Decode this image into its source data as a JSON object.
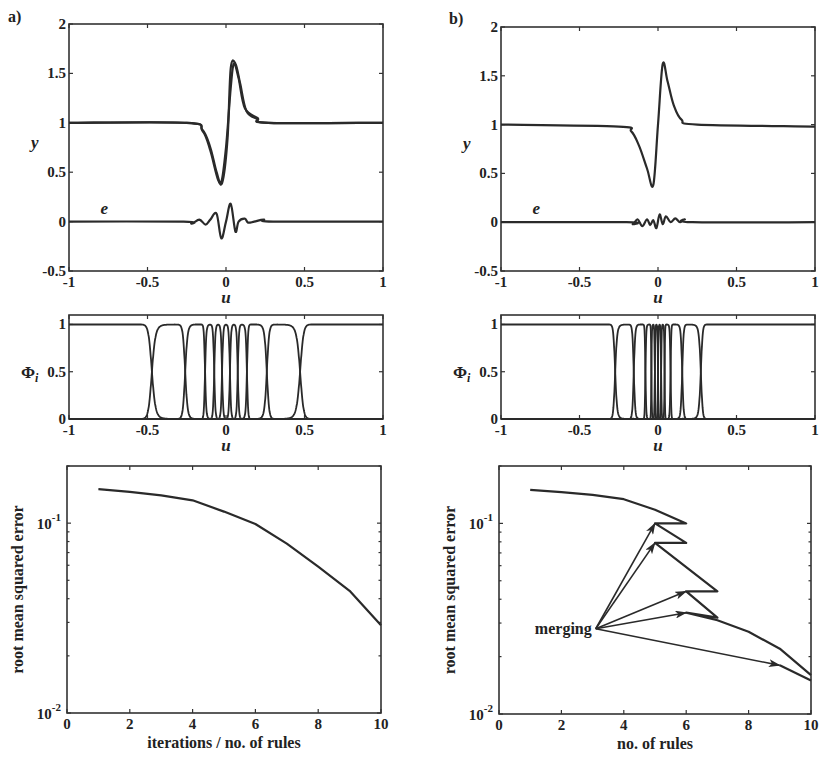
{
  "figure": {
    "panel_labels": [
      "a)",
      "b)"
    ]
  },
  "chart_data": [
    {
      "id": "a-top",
      "panel": "a)",
      "type": "line",
      "xlabel": "u",
      "ylabel": "y",
      "xlim": [
        -1,
        1
      ],
      "ylim": [
        -0.5,
        2
      ],
      "xticks": [
        "-1",
        "-0.5",
        "0",
        "0.5",
        "1"
      ],
      "yticks": [
        "-0.5",
        "0",
        "0.5",
        "1",
        "1.5",
        "2"
      ],
      "annotations": [
        {
          "text": "e",
          "x": -0.8,
          "y": 0.08
        }
      ],
      "series": [
        {
          "name": "y (target)",
          "x": [
            -1,
            -0.25,
            -0.15,
            -0.1,
            -0.06,
            -0.03,
            0.0,
            0.03,
            0.05,
            0.08,
            0.12,
            0.2,
            0.27,
            1
          ],
          "values": [
            1,
            1,
            0.93,
            0.75,
            0.5,
            0.4,
            0.75,
            1.35,
            1.6,
            1.45,
            1.15,
            1.05,
            1,
            1
          ]
        },
        {
          "name": "y (model)",
          "x": [
            -1,
            -0.25,
            -0.15,
            -0.1,
            -0.05,
            -0.02,
            0.01,
            0.03,
            0.06,
            0.09,
            0.13,
            0.2,
            0.27,
            1
          ],
          "values": [
            1,
            1,
            0.92,
            0.72,
            0.42,
            0.42,
            0.85,
            1.55,
            1.6,
            1.4,
            1.12,
            1.04,
            1,
            1
          ]
        },
        {
          "name": "e",
          "x": [
            -1,
            -0.27,
            -0.22,
            -0.17,
            -0.13,
            -0.1,
            -0.06,
            -0.03,
            0.0,
            0.03,
            0.06,
            0.08,
            0.12,
            0.14,
            0.18,
            0.24,
            0.3,
            1
          ],
          "values": [
            0,
            0,
            -0.02,
            0.02,
            -0.03,
            0.02,
            0.08,
            -0.17,
            0.0,
            0.18,
            -0.1,
            0.0,
            0.03,
            -0.01,
            0.0,
            0.02,
            0,
            0
          ]
        }
      ]
    },
    {
      "id": "a-mid",
      "panel": "a)",
      "type": "line",
      "xlabel": "u",
      "ylabel": "Φi",
      "xlim": [
        -1,
        1
      ],
      "ylim": [
        0,
        1.1
      ],
      "xticks": [
        "-1",
        "-0.5",
        "0",
        "0.5",
        "1"
      ],
      "yticks": [
        "0",
        "0.5",
        "1"
      ],
      "membership_centers": [
        -1,
        -0.35,
        -0.2,
        -0.1,
        -0.05,
        0.0,
        0.05,
        0.1,
        0.2,
        0.35,
        1
      ],
      "note": "normalized membership functions; crossings near ±0.5, ±0.27, ±0.15"
    },
    {
      "id": "a-bottom",
      "panel": "a)",
      "type": "line",
      "xlabel": "iterations / no. of rules",
      "ylabel": "root mean squared error",
      "yscale": "log",
      "xlim": [
        0,
        10
      ],
      "ylim": [
        0.01,
        0.2
      ],
      "xticks": [
        "0",
        "2",
        "4",
        "6",
        "8",
        "10"
      ],
      "yticks": [
        "10^-2",
        "10^-1"
      ],
      "x": [
        1,
        2,
        3,
        4,
        5,
        6,
        7,
        8,
        9,
        10
      ],
      "values": [
        0.151,
        0.146,
        0.14,
        0.132,
        0.115,
        0.099,
        0.078,
        0.059,
        0.044,
        0.029
      ]
    },
    {
      "id": "b-top",
      "panel": "b)",
      "type": "line",
      "xlabel": "u",
      "ylabel": "y",
      "xlim": [
        -1,
        1
      ],
      "ylim": [
        -0.5,
        2
      ],
      "xticks": [
        "-1",
        "-0.5",
        "0",
        "0.5",
        "1"
      ],
      "yticks": [
        "-0.5",
        "0",
        "0.5",
        "1",
        "1.5",
        "2"
      ],
      "annotations": [
        {
          "text": "e",
          "x": -0.8,
          "y": 0.08
        }
      ],
      "series": [
        {
          "name": "y",
          "x": [
            -1,
            -0.25,
            -0.17,
            -0.12,
            -0.07,
            -0.03,
            0.0,
            0.03,
            0.06,
            0.1,
            0.15,
            0.25,
            1
          ],
          "values": [
            1,
            0.98,
            0.93,
            0.78,
            0.55,
            0.38,
            1.0,
            1.62,
            1.45,
            1.2,
            1.05,
            1.0,
            0.98
          ]
        },
        {
          "name": "e",
          "x": [
            -1,
            -0.2,
            -0.16,
            -0.13,
            -0.1,
            -0.07,
            -0.05,
            -0.03,
            -0.01,
            0.01,
            0.03,
            0.05,
            0.08,
            0.11,
            0.14,
            0.17,
            0.22,
            1
          ],
          "values": [
            0,
            0,
            -0.02,
            0.03,
            -0.04,
            0.03,
            -0.03,
            0.02,
            -0.06,
            0.08,
            -0.02,
            0.06,
            0.0,
            0.04,
            0.0,
            0.03,
            0,
            0
          ]
        }
      ]
    },
    {
      "id": "b-mid",
      "panel": "b)",
      "type": "line",
      "xlabel": "u",
      "ylabel": "Φi",
      "xlim": [
        -1,
        1
      ],
      "ylim": [
        0,
        1.1
      ],
      "xticks": [
        "-1",
        "-0.5",
        "0",
        "0.5",
        "1"
      ],
      "yticks": [
        "0",
        "0.5",
        "1"
      ],
      "membership_centers": [
        -1,
        -0.2,
        -0.12,
        -0.06,
        -0.03,
        -0.01,
        0.01,
        0.03,
        0.06,
        0.12,
        0.2,
        1
      ],
      "note": "membership functions concentrated within [-0.27, 0.27]"
    },
    {
      "id": "b-bottom",
      "panel": "b)",
      "type": "line",
      "xlabel": "no. of rules",
      "ylabel": "root mean squared error",
      "yscale": "log",
      "xlim": [
        0,
        10
      ],
      "ylim": [
        0.01,
        0.2
      ],
      "xticks": [
        "0",
        "2",
        "4",
        "6",
        "8",
        "10"
      ],
      "yticks": [
        "10^-2",
        "10^-1"
      ],
      "path": {
        "x": [
          1,
          2,
          3,
          4,
          5,
          6,
          5,
          6,
          5,
          7,
          6,
          7,
          6,
          7,
          8,
          9,
          10
        ],
        "values": [
          0.15,
          0.146,
          0.141,
          0.134,
          0.118,
          0.1,
          0.1,
          0.079,
          0.079,
          0.044,
          0.044,
          0.032,
          0.034,
          0.031,
          0.027,
          0.022,
          0.016
        ]
      },
      "secondary_path": {
        "x": [
          9,
          10
        ],
        "values": [
          0.018,
          0.015
        ]
      },
      "annotations": [
        {
          "text": "merging",
          "x": 3.1,
          "y": 0.028,
          "arrows_to": [
            [
              5,
              0.1
            ],
            [
              5,
              0.079
            ],
            [
              6,
              0.044
            ],
            [
              6,
              0.034
            ],
            [
              9,
              0.018
            ]
          ]
        }
      ]
    }
  ]
}
